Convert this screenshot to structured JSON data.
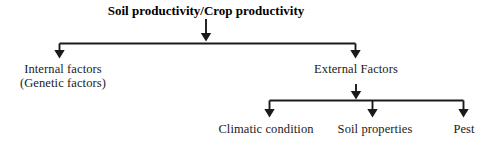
{
  "diagram": {
    "type": "hierarchy-flowchart",
    "orientation": "top-down",
    "line_color": "#1a1a1a",
    "background_color": "#ffffff",
    "root": {
      "id": "root",
      "label": "Soil productivity/Crop productivity",
      "bold": true,
      "center_x": 206,
      "top_y": 4
    },
    "level1": [
      {
        "id": "internal-factors",
        "label_line1": "Internal factors",
        "label_line2": "(Genetic factors)",
        "center_x": 63,
        "top_y": 62
      },
      {
        "id": "external-factors",
        "label_line1": "External Factors",
        "label_line2": "",
        "center_x": 356,
        "top_y": 62
      }
    ],
    "level2": [
      {
        "id": "climatic-condition",
        "label": "Climatic condition",
        "center_x": 266,
        "top_y": 122
      },
      {
        "id": "soil-properties",
        "label": "Soil properties",
        "center_x": 375,
        "top_y": 122
      },
      {
        "id": "pest",
        "label": "Pest",
        "center_x": 464,
        "top_y": 122
      }
    ],
    "edges": [
      {
        "id": "root-to-split",
        "from": "root",
        "to": "level1-bus"
      },
      {
        "id": "split-to-internal",
        "from": "level1-bus",
        "to": "internal-factors"
      },
      {
        "id": "split-to-external",
        "from": "level1-bus",
        "to": "external-factors"
      },
      {
        "id": "external-to-split",
        "from": "external-factors",
        "to": "level2-bus"
      },
      {
        "id": "split-to-climatic",
        "from": "level2-bus",
        "to": "climatic-condition"
      },
      {
        "id": "split-to-soil",
        "from": "level2-bus",
        "to": "soil-properties"
      },
      {
        "id": "split-to-pest",
        "from": "level2-bus",
        "to": "pest"
      }
    ]
  }
}
